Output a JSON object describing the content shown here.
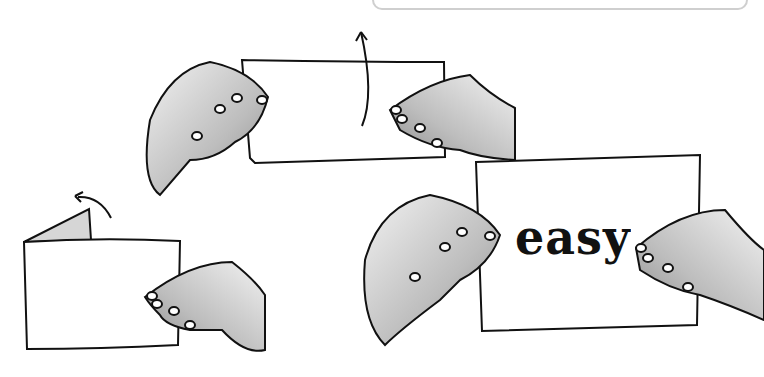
{
  "illustration": {
    "description": "Three-step paper folding illustration with hands",
    "panels": [
      {
        "step": 1,
        "label": "fold-corner",
        "arrow": "curved-arrow-up"
      },
      {
        "step": 2,
        "label": "fold-paper-in-half",
        "arrow": "curved-arrow-up"
      },
      {
        "step": 3,
        "label": "reveal-word",
        "word": "easy"
      }
    ],
    "revealed_word": "easy",
    "colors": {
      "ink": "#111111",
      "skin_shade": "#a8a8a8",
      "paper": "#ffffff",
      "frame": "#cfcfcf"
    }
  }
}
